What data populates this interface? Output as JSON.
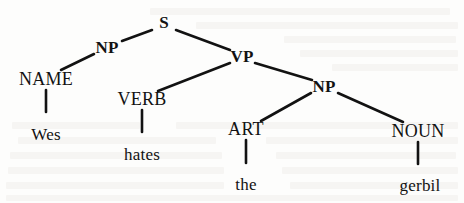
{
  "diagram": {
    "type": "syntax-tree",
    "sentence": "Wes hates the gerbil",
    "ink_color": "#121212",
    "background_color": "#fdfdfc",
    "nodes": [
      {
        "id": "s",
        "label": "S",
        "style": "bold",
        "x": 164,
        "y": 22
      },
      {
        "id": "np1",
        "label": "NP",
        "style": "bold",
        "x": 107,
        "y": 47
      },
      {
        "id": "vp",
        "label": "VP",
        "style": "bold",
        "x": 242,
        "y": 56
      },
      {
        "id": "name",
        "label": "NAME",
        "style": "plain",
        "x": 46,
        "y": 79
      },
      {
        "id": "verb",
        "label": "VERB",
        "style": "plain",
        "x": 142,
        "y": 99
      },
      {
        "id": "np2",
        "label": "NP",
        "style": "bold",
        "x": 324,
        "y": 86
      },
      {
        "id": "art",
        "label": "ART",
        "style": "plain",
        "x": 246,
        "y": 129
      },
      {
        "id": "noun",
        "label": "NOUN",
        "style": "plain",
        "x": 418,
        "y": 131
      },
      {
        "id": "wes",
        "label": "Wes",
        "style": "leaf",
        "x": 46,
        "y": 134
      },
      {
        "id": "hates",
        "label": "hates",
        "style": "leaf",
        "x": 142,
        "y": 154
      },
      {
        "id": "the",
        "label": "the",
        "style": "leaf",
        "x": 246,
        "y": 184
      },
      {
        "id": "gerbil",
        "label": "gerbil",
        "style": "leaf",
        "x": 420,
        "y": 185
      }
    ],
    "edges": [
      {
        "from": "s",
        "to": "np1",
        "x1": 152,
        "y1": 30,
        "x2": 122,
        "y2": 41
      },
      {
        "from": "s",
        "to": "vp",
        "x1": 176,
        "y1": 30,
        "x2": 230,
        "y2": 50
      },
      {
        "from": "np1",
        "to": "name",
        "x1": 94,
        "y1": 54,
        "x2": 61,
        "y2": 70
      },
      {
        "from": "vp",
        "to": "verb",
        "x1": 230,
        "y1": 63,
        "x2": 158,
        "y2": 91
      },
      {
        "from": "vp",
        "to": "np2",
        "x1": 255,
        "y1": 63,
        "x2": 312,
        "y2": 80
      },
      {
        "from": "np2",
        "to": "art",
        "x1": 311,
        "y1": 93,
        "x2": 261,
        "y2": 121
      },
      {
        "from": "np2",
        "to": "noun",
        "x1": 338,
        "y1": 93,
        "x2": 403,
        "y2": 122
      },
      {
        "from": "name",
        "to": "wes",
        "x1": 46,
        "y1": 90,
        "x2": 46,
        "y2": 112
      },
      {
        "from": "verb",
        "to": "hates",
        "x1": 142,
        "y1": 110,
        "x2": 142,
        "y2": 132
      },
      {
        "from": "art",
        "to": "the",
        "x1": 246,
        "y1": 140,
        "x2": 246,
        "y2": 163
      },
      {
        "from": "noun",
        "to": "gerbil",
        "x1": 418,
        "y1": 142,
        "x2": 418,
        "y2": 164
      }
    ]
  }
}
